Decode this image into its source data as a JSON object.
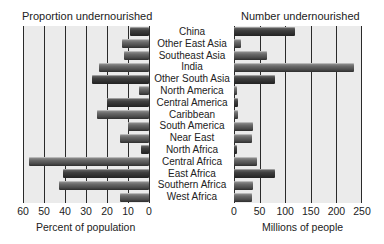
{
  "chart_data": [
    {
      "type": "bar",
      "orientation": "horizontal",
      "direction": "right-to-left",
      "title": "Proportion undernourished",
      "xlabel": "Percent of population",
      "ylabel": "",
      "xlim": [
        0,
        60
      ],
      "ticks": [
        "60",
        "50",
        "40",
        "30",
        "20",
        "10",
        "0"
      ],
      "grid": true,
      "categories": [
        "China",
        "Other East Asia",
        "Southeast Asia",
        "India",
        "Other South Asia",
        "North America",
        "Central America",
        "Caribbean",
        "South America",
        "Near East",
        "North Africa",
        "Central Africa",
        "East Africa",
        "Southern Africa",
        "West Africa"
      ],
      "values": [
        9,
        13,
        12,
        24,
        27,
        5,
        20,
        25,
        10,
        14,
        4,
        57,
        41,
        43,
        14
      ]
    },
    {
      "type": "bar",
      "orientation": "horizontal",
      "direction": "left-to-right",
      "title": "Number undernourished",
      "xlabel": "Millions of people",
      "ylabel": "",
      "xlim": [
        0,
        250
      ],
      "ticks": [
        "0",
        "50",
        "100",
        "150",
        "200",
        "250"
      ],
      "grid": true,
      "categories": [
        "China",
        "Other East Asia",
        "Southeast Asia",
        "India",
        "Other South Asia",
        "North America",
        "Central America",
        "Caribbean",
        "South America",
        "Near East",
        "North Africa",
        "Central Africa",
        "East Africa",
        "Southern Africa",
        "West Africa"
      ],
      "values": [
        119,
        13,
        64,
        234,
        80,
        6,
        8,
        8,
        38,
        36,
        6,
        45,
        81,
        38,
        35
      ]
    }
  ],
  "left": {
    "title": "Proportion undernourished",
    "axis_title": "Percent of population",
    "ticks": [
      "60",
      "50",
      "40",
      "30",
      "20",
      "10",
      "0"
    ]
  },
  "right": {
    "title": "Number undernourished",
    "axis_title": "Millions of people",
    "ticks": [
      "0",
      "50",
      "100",
      "150",
      "200",
      "250"
    ]
  },
  "regions": [
    "China",
    "Other East Asia",
    "Southeast Asia",
    "India",
    "Other South Asia",
    "North America",
    "Central America",
    "Caribbean",
    "South America",
    "Near East",
    "North Africa",
    "Central Africa",
    "East Africa",
    "Southern Africa",
    "West Africa"
  ],
  "colors": {
    "plot_bg": "#ebebeb",
    "bar": "#5a5a5a",
    "bar_dark": "#333333",
    "grid": "#2a2a2a"
  }
}
